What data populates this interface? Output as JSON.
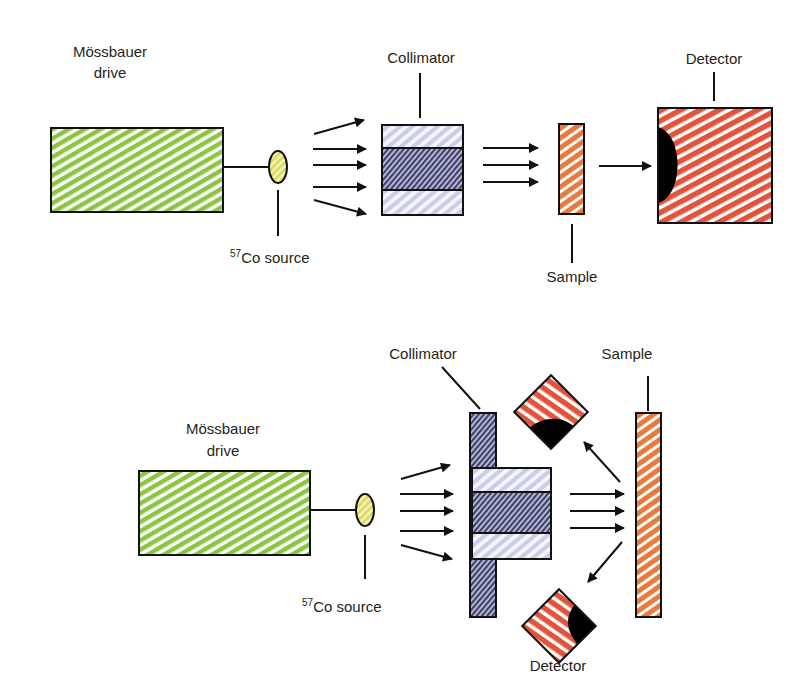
{
  "figure": {
    "type": "schematic",
    "colors": {
      "drive_green": "#8cc63f",
      "source_yellow": "#e6e46a",
      "collimator_light": "#c9cde6",
      "collimator_dark": "#4a4a78",
      "sample_orange": "#ea7a3c",
      "detector_red": "#e2533b",
      "outline": "#111111",
      "background": "#ffffff"
    }
  },
  "transmission": {
    "name": "transmission-geometry",
    "drive_label_line1": "Mössbauer",
    "drive_label_line2": "drive",
    "source_label_sup": "57",
    "source_label_text": "Co source",
    "collimator_label": "Collimator",
    "sample_label": "Sample",
    "detector_label": "Detector",
    "arrows_to_collimator": 5,
    "arrows_to_sample": 3,
    "arrows_to_detector": 1
  },
  "backscatter": {
    "name": "backscatter-geometry",
    "drive_label_line1": "Mössbauer",
    "drive_label_line2": "drive",
    "source_label_sup": "57",
    "source_label_text": "Co source",
    "collimator_label": "Collimator",
    "sample_label": "Sample",
    "detector_label": "Detector",
    "detector_count": 2,
    "arrows_to_collimator": 5,
    "arrows_to_sample": 3,
    "scattered_arrows": 2
  }
}
